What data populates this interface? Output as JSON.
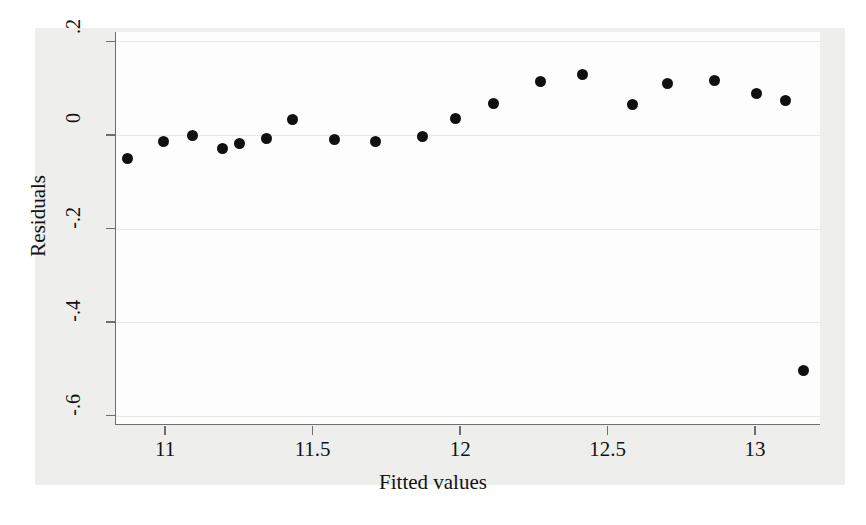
{
  "chart_data": {
    "type": "scatter",
    "title": "",
    "xlabel": "Fitted values",
    "ylabel": "Residuals",
    "xlim": [
      10.83,
      13.22
    ],
    "ylim": [
      -0.62,
      0.22
    ],
    "xticks": [
      "11",
      "11.5",
      "12",
      "12.5",
      "13"
    ],
    "xtick_values": [
      11,
      11.5,
      12,
      12.5,
      13
    ],
    "yticks": [
      ".2",
      "0",
      "-.2",
      "-.4",
      "-.6"
    ],
    "ytick_values": [
      0.2,
      0,
      -0.2,
      -0.4,
      -0.6
    ],
    "grid": true,
    "legend": "none",
    "marker_color": "#101010",
    "marker_shape": "circle",
    "points": [
      {
        "x": 10.87,
        "y": -0.05
      },
      {
        "x": 10.99,
        "y": -0.014
      },
      {
        "x": 11.09,
        "y": -0.002
      },
      {
        "x": 11.19,
        "y": -0.029
      },
      {
        "x": 11.25,
        "y": -0.019
      },
      {
        "x": 11.34,
        "y": -0.008
      },
      {
        "x": 11.43,
        "y": 0.033
      },
      {
        "x": 11.57,
        "y": -0.01
      },
      {
        "x": 11.71,
        "y": -0.014
      },
      {
        "x": 11.87,
        "y": -0.004
      },
      {
        "x": 11.98,
        "y": 0.035
      },
      {
        "x": 12.11,
        "y": 0.068
      },
      {
        "x": 12.27,
        "y": 0.115
      },
      {
        "x": 12.41,
        "y": 0.13
      },
      {
        "x": 12.58,
        "y": 0.064
      },
      {
        "x": 12.7,
        "y": 0.109
      },
      {
        "x": 12.86,
        "y": 0.117
      },
      {
        "x": 13.0,
        "y": 0.089
      },
      {
        "x": 13.1,
        "y": 0.074
      },
      {
        "x": 13.16,
        "y": -0.503
      }
    ]
  },
  "figure": {
    "axis_color": "#6f6f6f",
    "plot_background": "#fdfdfd",
    "graph_background": "#eeeeec"
  }
}
